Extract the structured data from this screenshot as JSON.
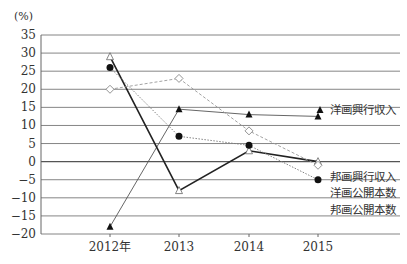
{
  "chart_data": {
    "type": "line",
    "title": "",
    "xlabel": "",
    "ylabel": "(%)",
    "ylim": [
      -20,
      35
    ],
    "yticks": [
      35,
      30,
      25,
      20,
      15,
      10,
      5,
      0,
      -5,
      -10,
      -15,
      -20
    ],
    "grid": true,
    "categories": [
      "2012年",
      "2013",
      "2014",
      "2015"
    ],
    "series": [
      {
        "name": "洋画興行収入",
        "marker": "filled-triangle",
        "style": "thin-solid",
        "values": [
          -18,
          14.5,
          13,
          12.5
        ]
      },
      {
        "name": "邦画興行収入",
        "marker": "open-triangle",
        "style": "thick-solid",
        "values": [
          29,
          -8,
          3,
          0
        ]
      },
      {
        "name": "洋画公開本数",
        "marker": "open-diamond",
        "style": "dashed",
        "values": [
          20,
          23,
          8.5,
          -1
        ]
      },
      {
        "name": "邦画公開本数",
        "marker": "filled-circle",
        "style": "dotted",
        "values": [
          26,
          7,
          4.5,
          -5
        ]
      }
    ],
    "legend_position": "right-inline"
  }
}
